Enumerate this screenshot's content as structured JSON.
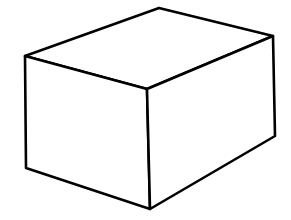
{
  "figure": {
    "background": "#ffffff",
    "stroke_color": "#000000",
    "stroke_width": 2.6,
    "vertices": {
      "top_back": [
        159,
        8
      ],
      "top_right": [
        273,
        36
      ],
      "top_left": [
        25,
        56
      ],
      "top_front": [
        147,
        89
      ],
      "bottom_left": [
        26,
        168
      ],
      "bottom_front": [
        150,
        209
      ],
      "bottom_right": [
        275,
        136
      ]
    },
    "faces": [
      {
        "name": "top-face",
        "points": "top_left top_back top_right top_front"
      },
      {
        "name": "front-left-face",
        "points": "top_left top_front bottom_front bottom_left"
      },
      {
        "name": "front-right-face",
        "points": "top_front top_right bottom_right bottom_front"
      }
    ]
  }
}
